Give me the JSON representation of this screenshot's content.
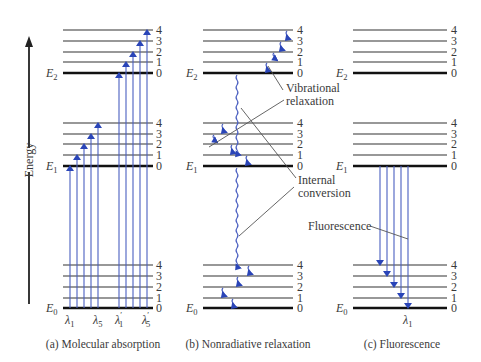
{
  "figure": {
    "axis_label": "Energy",
    "colors": {
      "transition_arrows": "#4a5fc0",
      "arrowheads": "#2a45b8",
      "levels": "#333333"
    },
    "vibrational_levels": [
      "0",
      "1",
      "2",
      "3",
      "4"
    ],
    "electronic_states": [
      {
        "symbol": "E",
        "sub": "2"
      },
      {
        "symbol": "E",
        "sub": "1"
      },
      {
        "symbol": "E",
        "sub": "0"
      }
    ],
    "panels": [
      {
        "id": "a",
        "caption": "(a) Molecular absorption",
        "wavelength_labels": [
          {
            "sym": "λ",
            "sub": "1",
            "prime": ""
          },
          {
            "sym": "λ",
            "sub": "5",
            "prime": ""
          },
          {
            "sym": "λ",
            "sub": "1",
            "prime": "′"
          },
          {
            "sym": "λ",
            "sub": "5",
            "prime": "′"
          }
        ]
      },
      {
        "id": "b",
        "caption": "(b) Nonradiative relaxation",
        "annotations": [
          {
            "line1": "Vibrational",
            "line2": "relaxation"
          },
          {
            "line1": "Internal",
            "line2": "conversion"
          }
        ]
      },
      {
        "id": "c",
        "caption": "(c) Fluorescence",
        "annotations": [
          {
            "line1": "Fluorescence"
          }
        ],
        "wavelength_labels": [
          {
            "sym": "λ",
            "sub": "1",
            "prime": ""
          }
        ]
      }
    ]
  }
}
